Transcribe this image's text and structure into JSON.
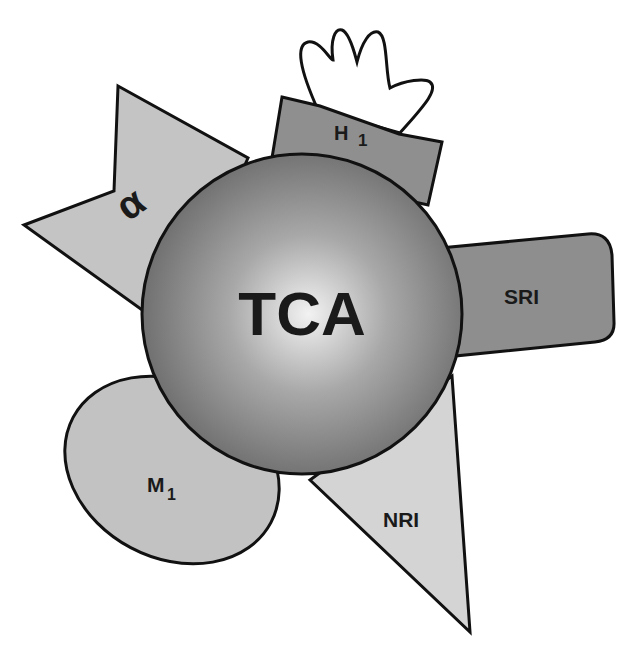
{
  "diagram": {
    "center": {
      "label": "TCA"
    },
    "receptors": [
      {
        "id": "alpha",
        "label": "α",
        "shape": "chevron-triangle",
        "color": "#c4c4c4"
      },
      {
        "id": "h1",
        "label": "H",
        "subscript": "1",
        "shape": "trapezoid",
        "color": "#8f8f8f"
      },
      {
        "id": "sri",
        "label": "SRI",
        "shape": "rounded-tab",
        "color": "#8e8e8e"
      },
      {
        "id": "m1",
        "label": "M",
        "subscript": "1",
        "shape": "ellipse",
        "color": "#c2c2c2"
      },
      {
        "id": "nri",
        "label": "NRI",
        "shape": "triangle",
        "color": "#d4d4d4"
      }
    ],
    "hand": {
      "shape": "hand-outline",
      "color": "#ffffff"
    }
  }
}
